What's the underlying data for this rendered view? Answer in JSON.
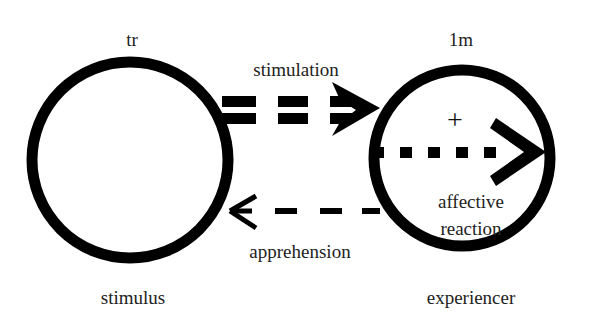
{
  "diagram": {
    "type": "interaction-schema",
    "colors": {
      "stroke": "#000000",
      "text": "#222222",
      "background": "#ffffff"
    },
    "nodes": [
      {
        "id": "stimulus",
        "top_label": "tr",
        "bottom_label": "stimulus"
      },
      {
        "id": "experiencer",
        "top_label": "1m",
        "bottom_label": "experiencer",
        "inner_symbol": "+",
        "inner_label_line1": "affective",
        "inner_label_line2": "reaction"
      }
    ],
    "edges": [
      {
        "from": "stimulus",
        "to": "experiencer",
        "label": "stimulation",
        "style": "double-dashed"
      },
      {
        "from": "experiencer",
        "to": "experiencer",
        "label": "affective reaction",
        "style": "dotted"
      },
      {
        "from": "experiencer",
        "to": "stimulus",
        "label": "apprehension",
        "style": "dashed"
      }
    ]
  }
}
